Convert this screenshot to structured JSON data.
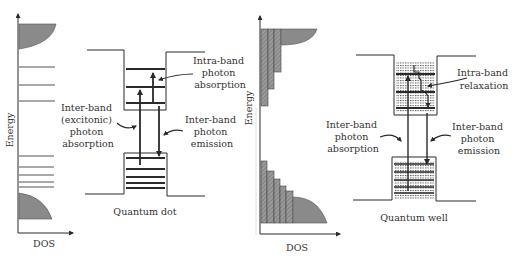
{
  "colors": {
    "ink": "#2a2a2a",
    "fill": "#8a8a8a",
    "background": "#ffffff"
  },
  "quantum_dot": {
    "caption": "Quantum dot",
    "axis": {
      "y_label": "Energy",
      "x_label": "DOS"
    },
    "labels": {
      "intra_band": [
        "Intra-band",
        "photon",
        "absorption"
      ],
      "inter_band_absorption": [
        "Inter-band",
        "(excitonic)",
        "photon",
        "absorption"
      ],
      "inter_band_emission": [
        "Inter-band",
        "photon",
        "emission"
      ]
    }
  },
  "quantum_well": {
    "caption": "Quantum well",
    "axis": {
      "y_label": "Energy",
      "x_label": "DOS"
    },
    "labels": {
      "intra_band": [
        "Intra-band",
        "relaxation"
      ],
      "inter_band_absorption": [
        "Inter-band",
        "photon",
        "absorption"
      ],
      "inter_band_emission": [
        "Inter-band",
        "photon",
        "emission"
      ]
    }
  }
}
